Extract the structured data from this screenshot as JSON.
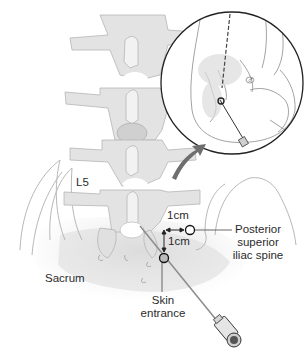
{
  "figure": {
    "colors": {
      "bone_fill": "#e4e4e4",
      "bone_shade": "#d2d2d2",
      "outline": "#b8b8b8",
      "ink": "#222222",
      "arrow": "#7a7a7a",
      "background": "#ffffff"
    }
  },
  "labels": {
    "vertebra": "L5",
    "sacrum": "Sacrum",
    "distance_horizontal": "1cm",
    "distance_vertical": "1cm",
    "psis_line1": "Posterior",
    "psis_line2": "superior",
    "psis_line3": "iliac spine",
    "skin_line1": "Skin",
    "skin_line2": "entrance"
  },
  "inset": {
    "description": "Magnified circular inset showing needle entering the sacroiliac region",
    "symbol": "♂"
  },
  "icons": {
    "psis_marker": "circle-marker",
    "skin_entrance_marker": "circle-marker",
    "needle": "spinal-needle",
    "magnify_arrow": "curved-arrow"
  }
}
